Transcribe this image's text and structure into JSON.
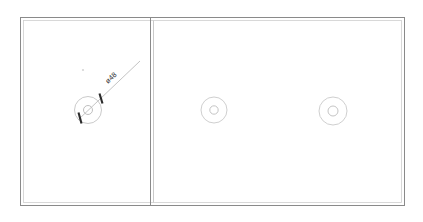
{
  "drawing": {
    "title": "plate-with-three-bores",
    "background_color": "#ffffff",
    "line_color_outer": "#8a8a8a",
    "line_color_inner": "#c8c8c8",
    "circle_color": "#c4c4c4",
    "annotation_color": "#2b2b2b",
    "border": {
      "name": "plate-outline",
      "x": 20.5,
      "y": 17.5,
      "width": 384,
      "height": 188,
      "inner_offset": 3
    },
    "divider": {
      "name": "panel-divider",
      "x_outer": 150.5,
      "x_inner": 153.5,
      "y_top": 17.5,
      "y_bottom": 205.5
    },
    "circles": [
      {
        "name": "bore-left",
        "cx": 88,
        "cy": 110,
        "outer_r": 13.5,
        "inner_r": 4.5
      },
      {
        "name": "bore-middle",
        "cx": 214,
        "cy": 110,
        "outer_r": 13,
        "inner_r": 4.2
      },
      {
        "name": "bore-right",
        "cx": 333,
        "cy": 111,
        "outer_r": 14,
        "inner_r": 5
      }
    ],
    "dimension": {
      "name": "diameter-dimension",
      "label": "ø48",
      "leader": {
        "x1": 78,
        "y1": 120,
        "x2": 140,
        "y2": 61
      },
      "tick_upper": {
        "x1": 99.5,
        "y1": 93.5,
        "x2": 102.5,
        "y2": 103.5
      },
      "tick_lower": {
        "x1": 78.5,
        "y1": 112.5,
        "x2": 81.5,
        "y2": 123.5
      },
      "text_x": 108,
      "text_y": 84,
      "text_rotation": -44
    },
    "marker_dot": {
      "name": "reference-dot",
      "cx": 83,
      "cy": 70,
      "r": 1.1
    }
  }
}
